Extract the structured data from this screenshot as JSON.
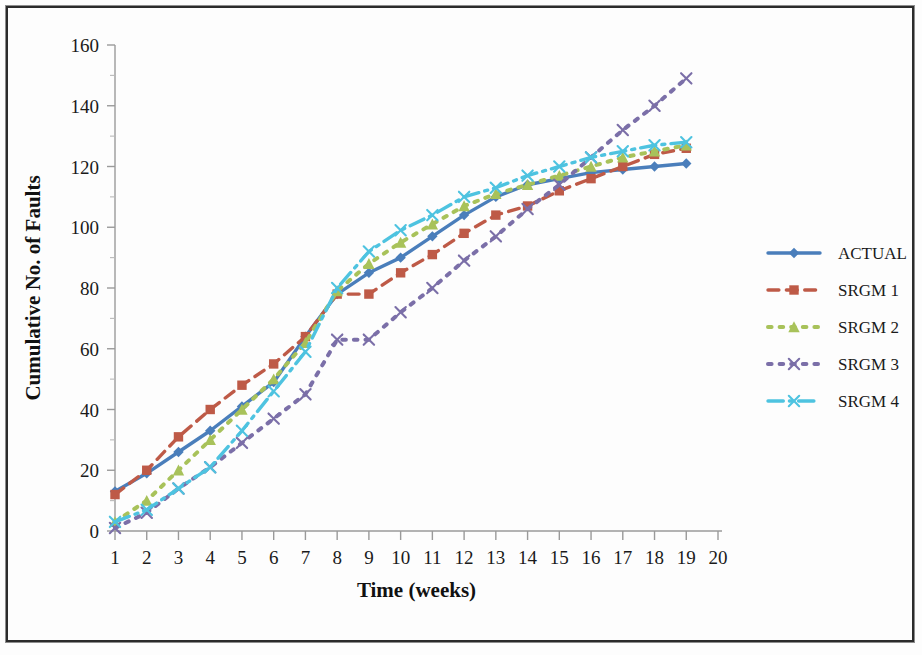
{
  "chart_data": {
    "type": "line",
    "title": "",
    "xlabel": "Time (weeks)",
    "ylabel": "Cumulative  No.  of  Faults",
    "xlim": [
      1,
      20
    ],
    "ylim": [
      0,
      160
    ],
    "y_major_step": 20,
    "y_minor_step": 10,
    "grid": false,
    "legend_position": "right",
    "x": [
      1,
      2,
      3,
      4,
      5,
      6,
      7,
      8,
      9,
      10,
      11,
      12,
      13,
      14,
      15,
      16,
      17,
      18,
      19
    ],
    "xtick_labels": [
      "1",
      "2",
      "3",
      "4",
      "5",
      "6",
      "7",
      "8",
      "9",
      "10",
      "11",
      "12",
      "13",
      "14",
      "15",
      "16",
      "17",
      "18",
      "19",
      "20"
    ],
    "ytick_labels": [
      "0",
      "20",
      "40",
      "60",
      "80",
      "100",
      "120",
      "140",
      "160"
    ],
    "series": [
      {
        "name": "ACTUAL",
        "color": "#4A7EBB",
        "style": "solid",
        "marker": "diamond",
        "values": [
          13,
          19,
          26,
          33,
          41,
          49,
          64,
          78,
          85,
          90,
          97,
          104,
          110,
          114,
          116,
          118,
          119,
          120,
          121
        ]
      },
      {
        "name": "SRGM 1",
        "color": "#BE5A47",
        "style": "dashed",
        "marker": "square",
        "values": [
          12,
          20,
          31,
          40,
          48,
          55,
          64,
          78,
          78,
          85,
          91,
          98,
          104,
          107,
          112,
          116,
          120,
          124,
          126
        ]
      },
      {
        "name": "SRGM 2",
        "color": "#A8C25A",
        "style": "dotted",
        "marker": "triangle",
        "values": [
          3,
          10,
          20,
          30,
          40,
          50,
          62,
          79,
          88,
          95,
          101,
          107,
          111,
          114,
          117,
          120,
          123,
          125,
          127
        ]
      },
      {
        "name": "SRGM 3",
        "color": "#7B6FA8",
        "style": "dotted",
        "marker": "x",
        "values": [
          1,
          6,
          14,
          21,
          29,
          37,
          45,
          63,
          63,
          72,
          80,
          89,
          97,
          106,
          114,
          123,
          132,
          140,
          149
        ]
      },
      {
        "name": "SRGM 4",
        "color": "#4EC3E0",
        "style": "dashdot",
        "marker": "x",
        "values": [
          3,
          7,
          14,
          21,
          33,
          46,
          59,
          80,
          92,
          99,
          104,
          110,
          113,
          117,
          120,
          123,
          125,
          127,
          128
        ]
      }
    ]
  },
  "legend": {
    "entries": [
      {
        "label": "ACTUAL"
      },
      {
        "label": "SRGM 1"
      },
      {
        "label": "SRGM 2"
      },
      {
        "label": "SRGM 3"
      },
      {
        "label": "SRGM 4"
      }
    ]
  }
}
